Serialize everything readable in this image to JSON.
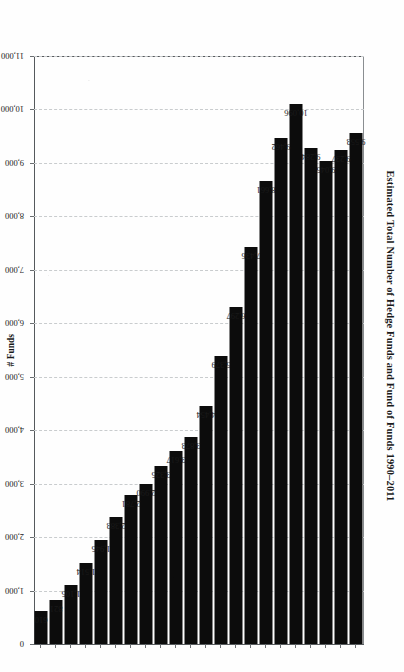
{
  "chart_data": {
    "type": "bar",
    "orientation": "horizontal",
    "title": "Estimated Total Number of Hedge Funds and Fund of Funds 1990–2011",
    "xlabel": "# Funds",
    "ylabel": "",
    "xlim": [
      0,
      11000
    ],
    "grid": true,
    "grid_style": "dashed vertical gridlines",
    "legend": false,
    "categories": [
      "2011",
      "2010",
      "2009",
      "2008",
      "2007",
      "2006",
      "2005",
      "2004",
      "2003",
      "2002",
      "2001",
      "2000",
      "1999",
      "1998",
      "1997",
      "1996",
      "1995",
      "1994",
      "1993",
      "1992",
      "1991",
      "1990"
    ],
    "values": [
      9553,
      9237,
      9045,
      9284,
      10096,
      9462,
      8661,
      7436,
      6297,
      5379,
      4454,
      3873,
      3617,
      3325,
      2990,
      2781,
      2383,
      1945,
      1514,
      1105,
      821,
      610
    ],
    "data_labels": [
      "9,553",
      "9,237",
      "9,045",
      "9,284",
      "10,096",
      "9,462",
      "8,661",
      "7,436",
      "6,297",
      "5,379",
      "4,454",
      "3,873",
      "3,617",
      "3,325",
      "2,990",
      "2,781",
      "2,383",
      "1,945",
      "1,514",
      "1,105",
      "821",
      "610"
    ],
    "xticks": [
      11000,
      10000,
      9000,
      8000,
      7000,
      6000,
      5000,
      4000,
      3000,
      2000,
      1000,
      0
    ],
    "xtick_labels": [
      "11,000",
      "10,000",
      "9,000",
      "8,000",
      "7,000",
      "6,000",
      "5,000",
      "4,000",
      "3,000",
      "2,000",
      "1,000",
      "0"
    ],
    "bar_color": "#0c0c0c",
    "background_color": "#fefefe",
    "axis_color": "#55595c",
    "gridline_color": "#c9ccce"
  },
  "figure": {
    "page_rotation": "90deg",
    "title": "Estimated Total Number of Hedge Funds and Fund of Funds 1990–2011",
    "axis_name": "# Funds"
  }
}
